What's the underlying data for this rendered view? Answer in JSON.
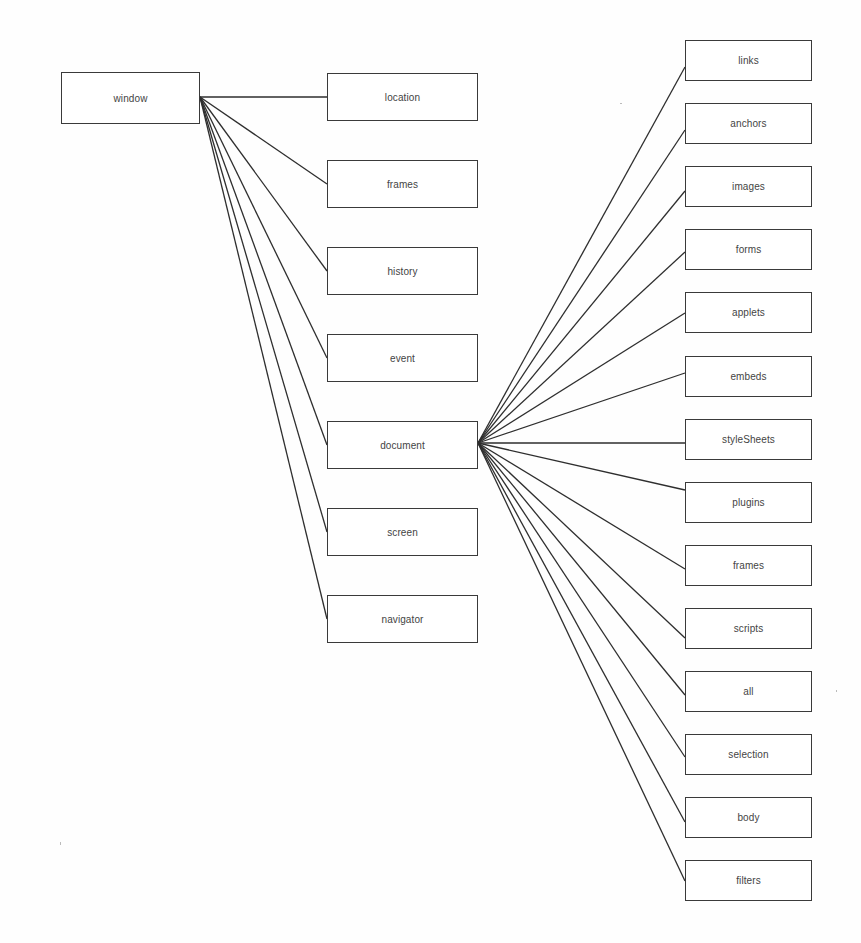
{
  "colors": {
    "line": "#2e2e2e",
    "border": "#3a3a3a",
    "text": "#444444",
    "background": "#fefefe"
  },
  "root": {
    "id": "window",
    "label": "window",
    "box": [
      61,
      72,
      139,
      52
    ],
    "anchor_out": [
      200,
      97
    ]
  },
  "level1": [
    {
      "id": "location",
      "label": "location",
      "box": [
        327,
        73,
        151,
        48
      ],
      "anchor_in": [
        327,
        97
      ]
    },
    {
      "id": "frames",
      "label": "frames",
      "box": [
        327,
        160,
        151,
        48
      ],
      "anchor_in": [
        327,
        184
      ]
    },
    {
      "id": "history",
      "label": "history",
      "box": [
        327,
        247,
        151,
        48
      ],
      "anchor_in": [
        327,
        271
      ]
    },
    {
      "id": "event",
      "label": "event",
      "box": [
        327,
        334,
        151,
        48
      ],
      "anchor_in": [
        327,
        358
      ]
    },
    {
      "id": "document",
      "label": "document",
      "box": [
        327,
        421,
        151,
        48
      ],
      "anchor_in": [
        327,
        445
      ],
      "anchor_out": [
        478,
        443
      ]
    },
    {
      "id": "screen",
      "label": "screen",
      "box": [
        327,
        508,
        151,
        48
      ],
      "anchor_in": [
        327,
        532
      ]
    },
    {
      "id": "navigator",
      "label": "navigator",
      "box": [
        327,
        595,
        151,
        48
      ],
      "anchor_in": [
        327,
        619
      ]
    }
  ],
  "level2": [
    {
      "id": "links",
      "label": "links",
      "box": [
        685,
        40,
        127,
        41
      ],
      "anchor_in": [
        685,
        67
      ]
    },
    {
      "id": "anchors",
      "label": "anchors",
      "box": [
        685,
        103,
        127,
        41
      ],
      "anchor_in": [
        685,
        130
      ]
    },
    {
      "id": "images",
      "label": "images",
      "box": [
        685,
        166,
        127,
        41
      ],
      "anchor_in": [
        685,
        191
      ]
    },
    {
      "id": "forms",
      "label": "forms",
      "box": [
        685,
        229,
        127,
        41
      ],
      "anchor_in": [
        685,
        252
      ]
    },
    {
      "id": "applets",
      "label": "applets",
      "box": [
        685,
        292,
        127,
        41
      ],
      "anchor_in": [
        685,
        313
      ]
    },
    {
      "id": "embeds",
      "label": "embeds",
      "box": [
        685,
        356,
        127,
        41
      ],
      "anchor_in": [
        685,
        373
      ]
    },
    {
      "id": "styleSheets",
      "label": "styleSheets",
      "box": [
        685,
        419,
        127,
        41
      ],
      "anchor_in": [
        685,
        443
      ]
    },
    {
      "id": "plugins",
      "label": "plugins",
      "box": [
        685,
        482,
        127,
        41
      ],
      "anchor_in": [
        685,
        490
      ]
    },
    {
      "id": "frames2",
      "label": "frames",
      "box": [
        685,
        545,
        127,
        41
      ],
      "anchor_in": [
        685,
        569
      ]
    },
    {
      "id": "scripts",
      "label": "scripts",
      "box": [
        685,
        608,
        127,
        41
      ],
      "anchor_in": [
        685,
        638
      ]
    },
    {
      "id": "all",
      "label": "all",
      "box": [
        685,
        671,
        127,
        41
      ],
      "anchor_in": [
        685,
        695
      ]
    },
    {
      "id": "selection",
      "label": "selection",
      "box": [
        685,
        734,
        127,
        41
      ],
      "anchor_in": [
        685,
        757
      ]
    },
    {
      "id": "body",
      "label": "body",
      "box": [
        685,
        797,
        127,
        41
      ],
      "anchor_in": [
        685,
        822
      ]
    },
    {
      "id": "filters",
      "label": "filters",
      "box": [
        685,
        860,
        127,
        41
      ],
      "anchor_in": [
        685,
        881
      ]
    }
  ]
}
